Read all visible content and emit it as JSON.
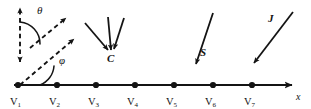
{
  "figure": {
    "name": "lattice-vector-diagram",
    "background": "#ffffff",
    "ink": "#141414",
    "width": 311,
    "height": 109
  },
  "axis": {
    "name": "x-axis",
    "label": "x",
    "label_x": 296,
    "label_y": 92,
    "y": 85,
    "x_start": 14,
    "x_end": 292,
    "arrowhead": true
  },
  "nodes": [
    {
      "label": "V",
      "sub": "1",
      "x": 18,
      "y": 85,
      "label_y": 97
    },
    {
      "label": "V",
      "sub": "2",
      "x": 57,
      "y": 85,
      "label_y": 97
    },
    {
      "label": "V",
      "sub": "3",
      "x": 96,
      "y": 85,
      "label_y": 97
    },
    {
      "label": "V",
      "sub": "4",
      "x": 135,
      "y": 85,
      "label_y": 97
    },
    {
      "label": "V",
      "sub": "5",
      "x": 174,
      "y": 85,
      "label_y": 97
    },
    {
      "label": "V",
      "sub": "6",
      "x": 213,
      "y": 85,
      "label_y": 97
    },
    {
      "label": "V",
      "sub": "7",
      "x": 252,
      "y": 85,
      "label_y": 97
    }
  ],
  "angles": [
    {
      "symbol": "θ",
      "name": "theta",
      "label_x": 37,
      "label_y": 5,
      "arc": "M 20 22 A 22 22 0 0 1 40 44",
      "description": "angle between vertical dashed axis and upper diagonal dashed vector"
    },
    {
      "symbol": "φ",
      "name": "phi",
      "label_x": 59,
      "label_y": 55,
      "arc": "M 40 85 A 22 22 0 0 0 54 66",
      "description": "angle between horizontal x axis and lower diagonal dashed vector"
    }
  ],
  "dashed_vectors": [
    {
      "name": "vertical-double-arrow",
      "x1": 20,
      "y1": 62,
      "x2": 20,
      "y2": 8,
      "arrow_start": true,
      "arrow_end": true
    },
    {
      "name": "upper-diagonal-arrow",
      "x1": 30,
      "y1": 48,
      "x2": 66,
      "y2": 18,
      "arrow_start": false,
      "arrow_end": true
    },
    {
      "name": "lower-diagonal-arrow",
      "x1": 20,
      "y1": 85,
      "x2": 74,
      "y2": 39,
      "arrow_start": false,
      "arrow_end": true
    }
  ],
  "solid_vectors": [
    {
      "name": "c-vector-left",
      "group": "C",
      "x1": 85,
      "y1": 23,
      "x2": 108,
      "y2": 50,
      "arrow_end": true
    },
    {
      "name": "c-vector-middle",
      "group": "C",
      "x1": 108,
      "y1": 17,
      "x2": 111,
      "y2": 50,
      "arrow_end": true
    },
    {
      "name": "c-vector-right",
      "group": "C",
      "x1": 124,
      "y1": 18,
      "x2": 114,
      "y2": 49,
      "arrow_end": true
    },
    {
      "name": "s-vector",
      "group": "S",
      "x1": 213,
      "y1": 13,
      "x2": 196,
      "y2": 64,
      "arrow_end": true
    },
    {
      "name": "j-vector",
      "group": "J",
      "x1": 293,
      "y1": 12,
      "x2": 254,
      "y2": 63,
      "arrow_end": true
    }
  ],
  "vector_labels": [
    {
      "text": "C",
      "name": "c-label",
      "x": 107,
      "y": 53
    },
    {
      "text": "S",
      "name": "s-label",
      "x": 200,
      "y": 47
    },
    {
      "text": "J",
      "name": "j-label",
      "x": 268,
      "y": 13
    }
  ]
}
